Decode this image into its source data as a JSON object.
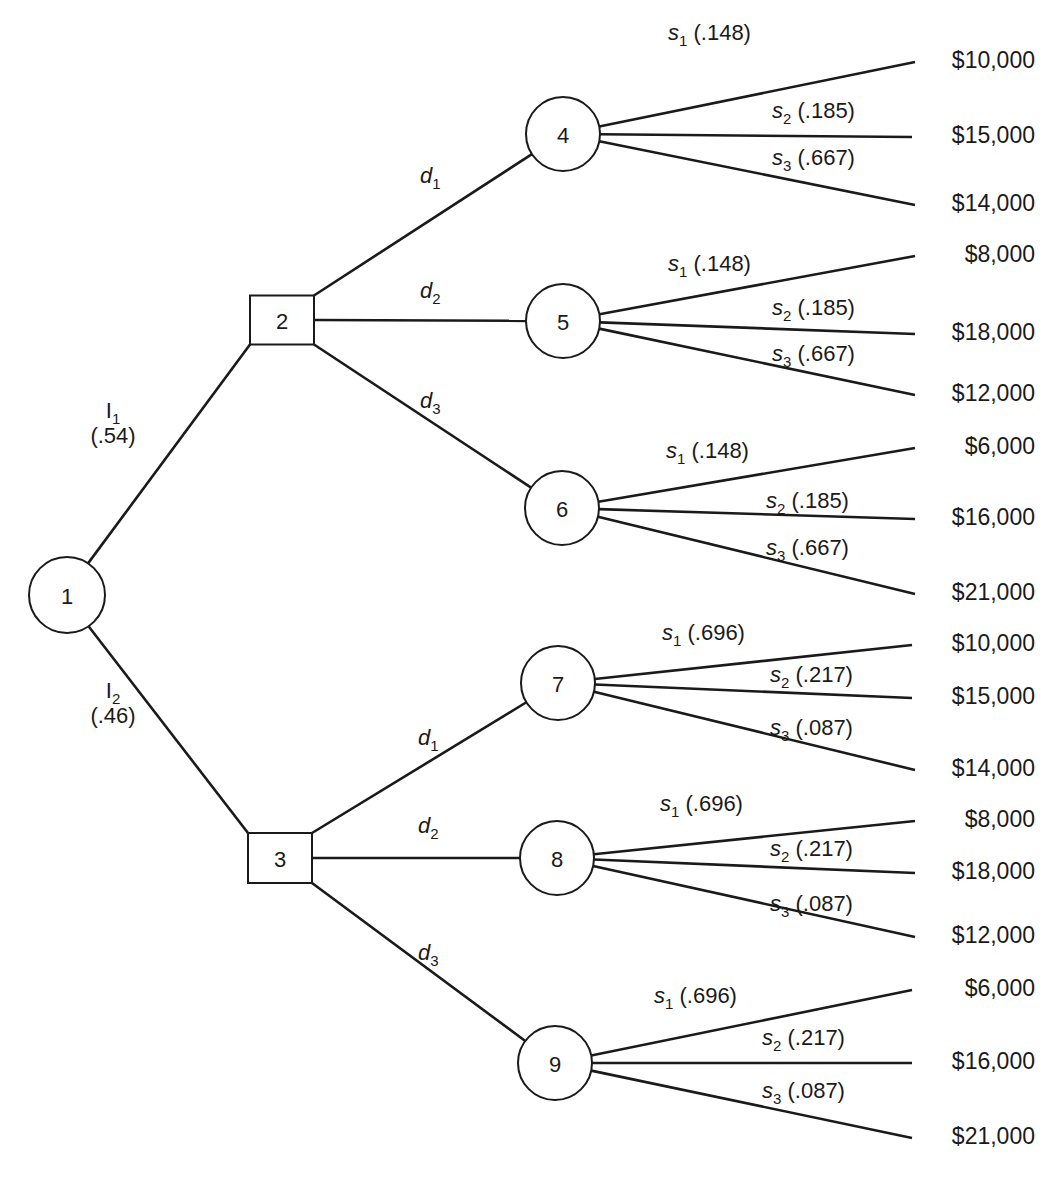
{
  "diagram": {
    "type": "decision-tree",
    "nodes": [
      {
        "id": "1",
        "kind": "chance",
        "cx": 67,
        "cy": 595,
        "r": 38
      },
      {
        "id": "2",
        "kind": "decision",
        "cx": 282,
        "cy": 320,
        "w": 64,
        "h": 49
      },
      {
        "id": "3",
        "kind": "decision",
        "cx": 280,
        "cy": 858,
        "w": 64,
        "h": 50
      },
      {
        "id": "4",
        "kind": "chance",
        "cx": 563,
        "cy": 134,
        "r": 37
      },
      {
        "id": "5",
        "kind": "chance",
        "cx": 563,
        "cy": 321,
        "r": 37
      },
      {
        "id": "6",
        "kind": "chance",
        "cx": 562,
        "cy": 508,
        "r": 37
      },
      {
        "id": "7",
        "kind": "chance",
        "cx": 558,
        "cy": 683,
        "r": 37
      },
      {
        "id": "8",
        "kind": "chance",
        "cx": 557,
        "cy": 858,
        "r": 37
      },
      {
        "id": "9",
        "kind": "chance",
        "cx": 555,
        "cy": 1063,
        "r": 37
      }
    ],
    "indicator_branches": [
      {
        "from": "1",
        "to": "2",
        "label": "I",
        "sub": "1",
        "prob": "(.54)"
      },
      {
        "from": "1",
        "to": "3",
        "label": "I",
        "sub": "2",
        "prob": "(.46)"
      }
    ],
    "decision_branches": [
      {
        "from": "2",
        "to": "4",
        "label": "d",
        "sub": "1"
      },
      {
        "from": "2",
        "to": "5",
        "label": "d",
        "sub": "2"
      },
      {
        "from": "2",
        "to": "6",
        "label": "d",
        "sub": "3"
      },
      {
        "from": "3",
        "to": "7",
        "label": "d",
        "sub": "1"
      },
      {
        "from": "3",
        "to": "8",
        "label": "d",
        "sub": "2"
      },
      {
        "from": "3",
        "to": "9",
        "label": "d",
        "sub": "3"
      }
    ],
    "state_branches": [
      {
        "node": "4",
        "branches": [
          {
            "label": "s",
            "sub": "1",
            "prob": "(.148)",
            "payoff": "$10,000"
          },
          {
            "label": "s",
            "sub": "2",
            "prob": "(.185)",
            "payoff": "$15,000"
          },
          {
            "label": "s",
            "sub": "3",
            "prob": "(.667)",
            "payoff": "$14,000"
          }
        ]
      },
      {
        "node": "5",
        "branches": [
          {
            "label": "s",
            "sub": "1",
            "prob": "(.148)",
            "payoff": "$8,000"
          },
          {
            "label": "s",
            "sub": "2",
            "prob": "(.185)",
            "payoff": "$18,000"
          },
          {
            "label": "s",
            "sub": "3",
            "prob": "(.667)",
            "payoff": "$12,000"
          }
        ]
      },
      {
        "node": "6",
        "branches": [
          {
            "label": "s",
            "sub": "1",
            "prob": "(.148)",
            "payoff": "$6,000"
          },
          {
            "label": "s",
            "sub": "2",
            "prob": "(.185)",
            "payoff": "$16,000"
          },
          {
            "label": "s",
            "sub": "3",
            "prob": "(.667)",
            "payoff": "$21,000"
          }
        ]
      },
      {
        "node": "7",
        "branches": [
          {
            "label": "s",
            "sub": "1",
            "prob": "(.696)",
            "payoff": "$10,000"
          },
          {
            "label": "s",
            "sub": "2",
            "prob": "(.217)",
            "payoff": "$15,000"
          },
          {
            "label": "s",
            "sub": "3",
            "prob": "(.087)",
            "payoff": "$14,000"
          }
        ]
      },
      {
        "node": "8",
        "branches": [
          {
            "label": "s",
            "sub": "1",
            "prob": "(.696)",
            "payoff": "$8,000"
          },
          {
            "label": "s",
            "sub": "2",
            "prob": "(.217)",
            "payoff": "$18,000"
          },
          {
            "label": "s",
            "sub": "3",
            "prob": "(.087)",
            "payoff": "$12,000"
          }
        ]
      },
      {
        "node": "9",
        "branches": [
          {
            "label": "s",
            "sub": "1",
            "prob": "(.696)",
            "payoff": "$6,000"
          },
          {
            "label": "s",
            "sub": "2",
            "prob": "(.217)",
            "payoff": "$16,000"
          },
          {
            "label": "s",
            "sub": "3",
            "prob": "(.087)",
            "payoff": "$21,000"
          }
        ]
      }
    ],
    "terminal_ends": [
      {
        "x": 915,
        "y": 62
      },
      {
        "x": 912,
        "y": 137
      },
      {
        "x": 915,
        "y": 205
      },
      {
        "x": 915,
        "y": 256
      },
      {
        "x": 915,
        "y": 334
      },
      {
        "x": 915,
        "y": 395
      },
      {
        "x": 915,
        "y": 448
      },
      {
        "x": 915,
        "y": 519
      },
      {
        "x": 915,
        "y": 594
      },
      {
        "x": 912,
        "y": 645
      },
      {
        "x": 912,
        "y": 698
      },
      {
        "x": 915,
        "y": 770
      },
      {
        "x": 915,
        "y": 821
      },
      {
        "x": 915,
        "y": 873
      },
      {
        "x": 915,
        "y": 937
      },
      {
        "x": 912,
        "y": 990
      },
      {
        "x": 912,
        "y": 1063
      },
      {
        "x": 912,
        "y": 1138
      }
    ]
  }
}
